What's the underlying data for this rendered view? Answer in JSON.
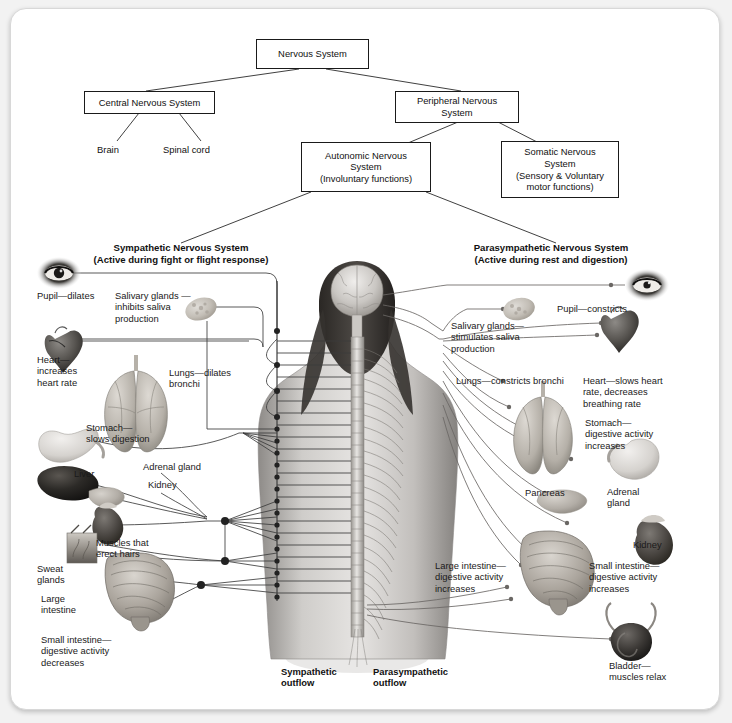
{
  "hierarchy": {
    "root": {
      "label": "Nervous System"
    },
    "cns": {
      "label": "Central Nervous System"
    },
    "pns": {
      "label": "Peripheral Nervous\nSystem"
    },
    "brain": {
      "label": "Brain"
    },
    "spinal_cord": {
      "label": "Spinal cord"
    },
    "autonomic": {
      "label": "Autonomic Nervous\nSystem\n(Involuntary functions)"
    },
    "somatic": {
      "label": "Somatic Nervous\nSystem\n(Sensory & Voluntary\nmotor functions)"
    }
  },
  "sections": {
    "sympathetic": {
      "heading": "Sympathetic Nervous System\n(Active during fight or flight response)"
    },
    "parasympathetic": {
      "heading": "Parasympathetic Nervous System\n(Active during rest and digestion)"
    }
  },
  "sympathetic_effects": [
    {
      "organ": "pupil",
      "label": "Pupil—dilates"
    },
    {
      "organ": "salivary-glands",
      "label": "Salivary glands —\ninhibits saliva\nproduction"
    },
    {
      "organ": "heart",
      "label": "Heart—\nincreases\nheart rate"
    },
    {
      "organ": "lungs",
      "label": "Lungs—dilates\nbronchi"
    },
    {
      "organ": "stomach",
      "label": "Stomach—\nslows digestion"
    },
    {
      "organ": "liver",
      "label": "Liver"
    },
    {
      "organ": "adrenal-gland",
      "label": "Adrenal gland"
    },
    {
      "organ": "kidney",
      "label": "Kidney"
    },
    {
      "organ": "hair-muscles",
      "label": "Muscles that\nerect hairs"
    },
    {
      "organ": "sweat-glands",
      "label": "Sweat\nglands"
    },
    {
      "organ": "large-intestine",
      "label": "Large\nintestine"
    },
    {
      "organ": "small-intestine",
      "label": "Small intestine—\ndigestive activity\ndecreases"
    }
  ],
  "parasympathetic_effects": [
    {
      "organ": "pupil",
      "label": "Pupil—constricts"
    },
    {
      "organ": "salivary-glands",
      "label": "Salivary glands—\nstimulates saliva\nproduction"
    },
    {
      "organ": "lungs",
      "label": "Lungs—constricts bronchi"
    },
    {
      "organ": "heart",
      "label": "Heart—slows heart\nrate, decreases\nbreathing rate"
    },
    {
      "organ": "stomach",
      "label": "Stomach—\ndigestive activity\nincreases"
    },
    {
      "organ": "pancreas",
      "label": "Pancreas"
    },
    {
      "organ": "adrenal-gland",
      "label": "Adrenal\ngland"
    },
    {
      "organ": "kidney",
      "label": "Kidney"
    },
    {
      "organ": "large-intestine",
      "label": "Large intestine—\ndigestive activity\nincreases"
    },
    {
      "organ": "small-intestine",
      "label": "Small intestine—\ndigestive activity\nincreases"
    },
    {
      "organ": "bladder",
      "label": "Bladder—\nmuscles relax"
    }
  ],
  "outflow": {
    "sympathetic": "Sympathetic\noutflow",
    "parasympathetic": "Parasympathetic\noutflow"
  },
  "colors": {
    "line": "#3c3c3c",
    "box_border": "#1a1a1a",
    "text": "#111111",
    "background": "#ffffff",
    "frame_border": "#d8d8d8"
  }
}
